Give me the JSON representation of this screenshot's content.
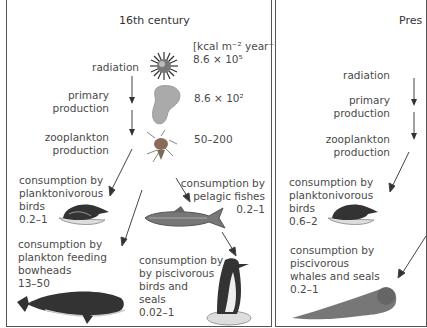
{
  "left_panel": {
    "title": "16th century",
    "units": "[kcal m⁻² year⁻¹]",
    "radiation_label": "radiation",
    "radiation_value": "8.6 × 10⁵",
    "primary_label_1": "primary",
    "primary_label_2": "production",
    "primary_value": "8.6 × 10²",
    "zoo_label_1": "zooplankton",
    "zoo_label_2": "production",
    "zoo_value": "50–200",
    "plank_birds": [
      "consumption by",
      "planktonivorous",
      "birds",
      "0.2–1"
    ],
    "pelagic_fish": [
      "consumption by",
      "pelagic fishes",
      "0.2–1"
    ],
    "bowheads": [
      "consumption by",
      "plankton feeding",
      "bowheads",
      "13–50"
    ],
    "pisc_birds": [
      "consumption by",
      "by piscivorous",
      "birds and",
      "seals",
      "0.02–1"
    ]
  },
  "right_panel": {
    "title": "Pres",
    "radiation_label": "radiation",
    "primary_label_1": "primary",
    "primary_label_2": "production",
    "zoo_label_1": "zooplankton",
    "zoo_label_2": "production",
    "plank_birds": [
      "consumption by",
      "planktonivorous",
      "birds",
      "0.6–2"
    ],
    "whales_seals": [
      "consumption by",
      "piscivorous",
      "whales and seals",
      "0.2–1"
    ]
  }
}
